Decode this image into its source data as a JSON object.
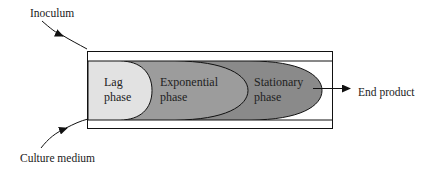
{
  "diagram": {
    "labels": {
      "inoculum": "Inoculum",
      "culture_medium": "Culture medium",
      "end_product": "End product"
    },
    "phases": [
      {
        "line1": "Lag",
        "line2": "phase",
        "fill": "#e2e2e2"
      },
      {
        "line1": "Exponential",
        "line2": "phase",
        "fill": "#9c9c9c"
      },
      {
        "line1": "Stationary",
        "line2": "phase",
        "fill": "#8a8a8a"
      }
    ],
    "colors": {
      "stroke": "#111111",
      "vessel_fill": "#ffffff"
    }
  }
}
